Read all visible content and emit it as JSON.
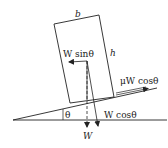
{
  "diagram": {
    "type": "free-body diagram",
    "labels": {
      "width": "b",
      "height": "h",
      "angle": "θ",
      "weight": "W",
      "w_sin": "W sinθ",
      "w_cos": "W cosθ",
      "friction": "μW cosθ"
    },
    "colors": {
      "stroke": "#222222",
      "background": "#ffffff"
    }
  }
}
